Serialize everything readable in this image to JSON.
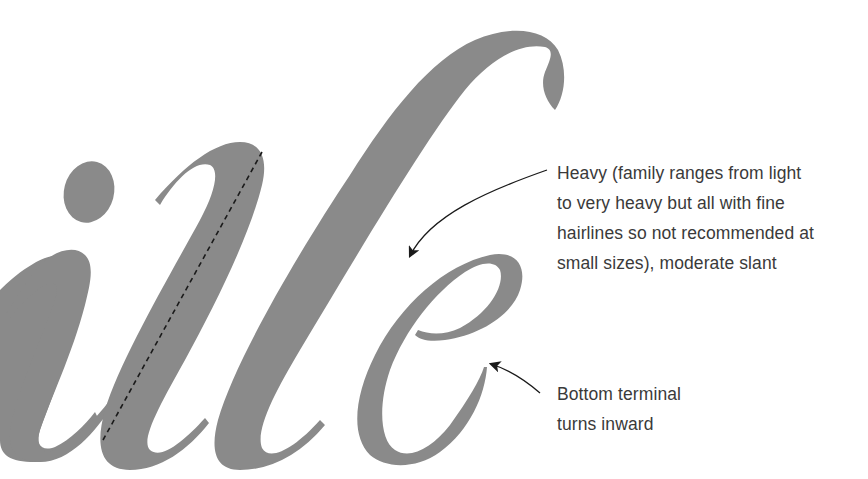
{
  "specimen": {
    "letters": "ille",
    "glyph_color": "#8a8a8a",
    "axis_line_style": "dashed",
    "axis_line_color": "#1a1a1a"
  },
  "annotations": [
    {
      "id": "weight",
      "lines": [
        "Heavy (family ranges from light",
        "to very heavy but all with fine",
        "hairlines so not recommended at",
        "small sizes), moderate slant"
      ]
    },
    {
      "id": "terminal",
      "lines": [
        "Bottom terminal",
        "turns inward"
      ]
    }
  ],
  "colors": {
    "background": "#ffffff",
    "text": "#3a3a3a",
    "arrow": "#1a1a1a"
  }
}
